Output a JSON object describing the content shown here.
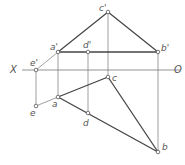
{
  "diagram": {
    "type": "orthographic-projection",
    "axis": {
      "left_label": "X",
      "right_label": "O",
      "y": 70,
      "x1": 22,
      "x2": 180
    },
    "colors": {
      "thick_line": "#444444",
      "thin_line": "#777777",
      "point_fill": "#ffffff",
      "point_stroke": "#555555"
    },
    "points": {
      "c_prime": {
        "label": "c'",
        "x": 108,
        "y": 12
      },
      "a_prime": {
        "label": "a'",
        "x": 58,
        "y": 52
      },
      "d_prime": {
        "label": "d'",
        "x": 88,
        "y": 52
      },
      "b_prime": {
        "label": "b'",
        "x": 158,
        "y": 52
      },
      "e_prime": {
        "label": "e'",
        "x": 36,
        "y": 70
      },
      "c": {
        "label": "c",
        "x": 108,
        "y": 77
      },
      "a": {
        "label": "a",
        "x": 58,
        "y": 97
      },
      "e": {
        "label": "e",
        "x": 36,
        "y": 106
      },
      "d": {
        "label": "d",
        "x": 88,
        "y": 113
      },
      "b": {
        "label": "b",
        "x": 158,
        "y": 152
      }
    }
  }
}
